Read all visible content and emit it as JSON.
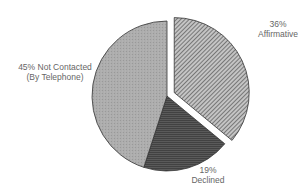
{
  "chart_data": {
    "type": "pie",
    "title": "",
    "categories": [
      "Affirmative",
      "Declined",
      "Not Contacted (By Telephone)"
    ],
    "values": [
      36,
      19,
      45
    ],
    "unit": "%",
    "exploded": [
      "Affirmative"
    ],
    "start_angle": "12 o'clock",
    "direction": "clockwise",
    "fills": {
      "Affirmative": "diagonal hatch (dark lines on light gray)",
      "Declined": "dark gray horizontal texture",
      "Not Contacted (By Telephone)": "light gray stipple"
    },
    "colors": {
      "Affirmative": "#9a9a9a",
      "Declined": "#4a4a4a",
      "Not Contacted (By Telephone)": "#a9a9a9"
    },
    "annotations": [
      {
        "category": "Not Contacted (By Telephone)",
        "line1": "45% Not Contacted",
        "line2": "(By Telephone)"
      },
      {
        "category": "Affirmative",
        "line1": "36%",
        "line2": "Affirmative"
      },
      {
        "category": "Declined",
        "line1": "19%",
        "line2": "Declined"
      }
    ]
  },
  "labels": {
    "not_contacted": {
      "line1": "45% Not Contacted",
      "line2": "(By Telephone)"
    },
    "affirmative": {
      "line1": "36%",
      "line2": "Affirmative"
    },
    "declined": {
      "line1": "19%",
      "line2": "Declined"
    }
  }
}
